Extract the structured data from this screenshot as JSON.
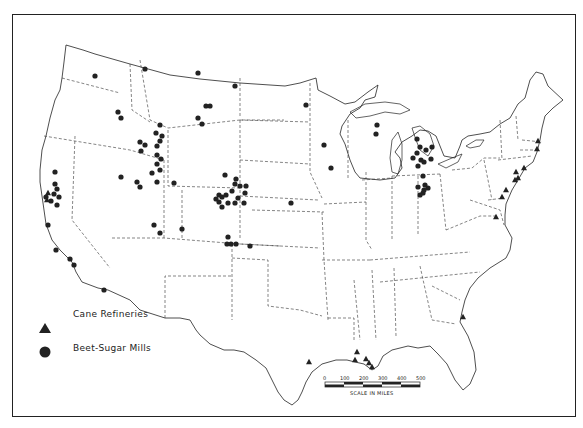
{
  "map": {
    "title": "Sugar Refineries and Mills — United States",
    "legend": {
      "items": [
        {
          "symbol": "triangle",
          "label": "Cane Refineries"
        },
        {
          "symbol": "circle",
          "label": "Beet-Sugar Mills"
        }
      ]
    },
    "scale": {
      "ticks": [
        "0",
        "100",
        "200",
        "300",
        "400",
        "500"
      ],
      "label": "SCALE IN MILES"
    },
    "colors": {
      "ink": "#222222",
      "paper": "#ffffff"
    },
    "beet_sugar_mills": [
      [
        95,
        76
      ],
      [
        145,
        69
      ],
      [
        198,
        73
      ],
      [
        235,
        86
      ],
      [
        206,
        106
      ],
      [
        210,
        106
      ],
      [
        118,
        112
      ],
      [
        121,
        118
      ],
      [
        198,
        118
      ],
      [
        202,
        124
      ],
      [
        160,
        125
      ],
      [
        156,
        133
      ],
      [
        162,
        136
      ],
      [
        140,
        142
      ],
      [
        145,
        145
      ],
      [
        141,
        151
      ],
      [
        157,
        146
      ],
      [
        160,
        141
      ],
      [
        157,
        155
      ],
      [
        161,
        159
      ],
      [
        157,
        164
      ],
      [
        160,
        170
      ],
      [
        157,
        182
      ],
      [
        152,
        173
      ],
      [
        121,
        177
      ],
      [
        137,
        182
      ],
      [
        140,
        187
      ],
      [
        174,
        183
      ],
      [
        236,
        179
      ],
      [
        225,
        175
      ],
      [
        240,
        186
      ],
      [
        235,
        184
      ],
      [
        232,
        191
      ],
      [
        219,
        195
      ],
      [
        222,
        197
      ],
      [
        226,
        195
      ],
      [
        228,
        203
      ],
      [
        238,
        198
      ],
      [
        244,
        203
      ],
      [
        246,
        186
      ],
      [
        216,
        199
      ],
      [
        219,
        202
      ],
      [
        222,
        207
      ],
      [
        235,
        203
      ],
      [
        245,
        193
      ],
      [
        291,
        203
      ],
      [
        154,
        225
      ],
      [
        160,
        233
      ],
      [
        182,
        229
      ],
      [
        228,
        237
      ],
      [
        231,
        244
      ],
      [
        236,
        244
      ],
      [
        227,
        244
      ],
      [
        250,
        246
      ],
      [
        55,
        172
      ],
      [
        55,
        184
      ],
      [
        57,
        189
      ],
      [
        54,
        194
      ],
      [
        59,
        197
      ],
      [
        57,
        205
      ],
      [
        51,
        201
      ],
      [
        46,
        197
      ],
      [
        48,
        225
      ],
      [
        56,
        250
      ],
      [
        70,
        259
      ],
      [
        74,
        265
      ],
      [
        104,
        290
      ],
      [
        306,
        105
      ],
      [
        324,
        145
      ],
      [
        331,
        168
      ],
      [
        377,
        125
      ],
      [
        376,
        134
      ],
      [
        417,
        139
      ],
      [
        420,
        147
      ],
      [
        417,
        153
      ],
      [
        421,
        160
      ],
      [
        413,
        158
      ],
      [
        418,
        166
      ],
      [
        426,
        150
      ],
      [
        432,
        147
      ],
      [
        431,
        159
      ],
      [
        424,
        162
      ],
      [
        423,
        176
      ],
      [
        425,
        185
      ],
      [
        418,
        187
      ],
      [
        428,
        188
      ],
      [
        424,
        190
      ],
      [
        423,
        193
      ],
      [
        420,
        195
      ]
    ],
    "cane_refineries": [
      [
        48,
        193
      ],
      [
        47,
        200
      ],
      [
        538,
        141
      ],
      [
        537,
        149
      ],
      [
        524,
        168
      ],
      [
        516,
        172
      ],
      [
        518,
        178
      ],
      [
        515,
        180
      ],
      [
        506,
        190
      ],
      [
        502,
        197
      ],
      [
        496,
        217
      ],
      [
        463,
        317
      ],
      [
        309,
        362
      ],
      [
        357,
        352
      ],
      [
        355,
        360
      ],
      [
        366,
        359
      ],
      [
        369,
        363
      ],
      [
        372,
        367
      ]
    ]
  }
}
